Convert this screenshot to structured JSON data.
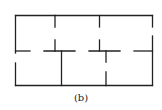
{
  "figure": {
    "caption": "(b)",
    "stroke_color": "#222222"
  }
}
